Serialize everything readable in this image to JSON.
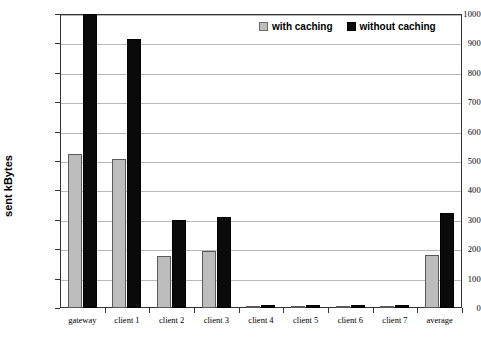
{
  "chart_data": {
    "type": "bar",
    "title": "",
    "xlabel": "",
    "ylabel": "sent kBytes",
    "ylim": [
      0,
      1000
    ],
    "yticks": [
      0,
      100,
      200,
      300,
      400,
      500,
      600,
      700,
      800,
      900,
      1000
    ],
    "grid": true,
    "legend_position": "top-right",
    "categories": [
      "gateway",
      "client 1",
      "client 2",
      "client 3",
      "client 4",
      "client 5",
      "client 6",
      "client 7",
      "average"
    ],
    "series": [
      {
        "name": "with caching",
        "color": "#bdbdbd",
        "values": [
          524,
          508,
          178,
          195,
          3,
          3,
          3,
          3,
          182
        ]
      },
      {
        "name": "without caching",
        "color": "#0a0a0a",
        "values": [
          1000,
          915,
          298,
          308,
          10,
          10,
          10,
          11,
          322
        ]
      }
    ]
  },
  "legend": {
    "entries": [
      {
        "label": "with caching",
        "swatch": "gray-square-icon"
      },
      {
        "label": "without caching",
        "swatch": "black-square-icon"
      }
    ]
  },
  "axes": {
    "y_title": "sent kBytes",
    "y_tick_labels": [
      "1000",
      "900",
      "800",
      "700",
      "600",
      "500",
      "400",
      "300",
      "200",
      "100",
      "0"
    ],
    "x_tick_labels": [
      "gateway",
      "client 1",
      "client 2",
      "client 3",
      "client 4",
      "client 5",
      "client 6",
      "client 7",
      "average"
    ]
  }
}
